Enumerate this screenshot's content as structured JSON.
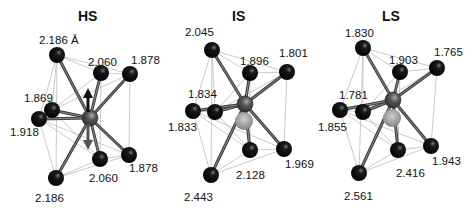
{
  "panels": [
    {
      "id": "hs",
      "title": "HS",
      "metal": {
        "x": 90,
        "y": 118
      },
      "arrow": true,
      "lower_sphere": false,
      "atoms": [
        {
          "name": "top-left",
          "x": 57,
          "y": 55,
          "bond": "2.186 Å",
          "lx": 39,
          "ly": 44
        },
        {
          "name": "top-mid",
          "x": 101,
          "y": 73,
          "bond": "2.060",
          "lx": 88,
          "ly": 66
        },
        {
          "name": "top-right",
          "x": 130,
          "y": 74,
          "bond": "1.878",
          "lx": 131,
          "ly": 64
        },
        {
          "name": "mid-inner",
          "x": 52,
          "y": 110,
          "bond": "1.869",
          "lx": 24,
          "ly": 102
        },
        {
          "name": "mid-left",
          "x": 39,
          "y": 119,
          "bond": "1.918",
          "lx": 10,
          "ly": 136
        },
        {
          "name": "bottom-left",
          "x": 56,
          "y": 178,
          "bond": "2.186",
          "lx": 35,
          "ly": 202
        },
        {
          "name": "bottom-mid",
          "x": 100,
          "y": 159,
          "bond": "2.060",
          "lx": 89,
          "ly": 182
        },
        {
          "name": "bottom-right",
          "x": 129,
          "y": 155,
          "bond": "1.878",
          "lx": 129,
          "ly": 172
        }
      ]
    },
    {
      "id": "is",
      "title": "IS",
      "metal": {
        "x": 245,
        "y": 104
      },
      "arrow": false,
      "lower_sphere": true,
      "sphere": {
        "x": 244,
        "y": 121
      },
      "atoms": [
        {
          "name": "top-left",
          "x": 212,
          "y": 50,
          "bond": "2.045",
          "lx": 185,
          "ly": 36
        },
        {
          "name": "top-mid",
          "x": 250,
          "y": 73,
          "bond": "1.896",
          "lx": 240,
          "ly": 65
        },
        {
          "name": "top-right",
          "x": 287,
          "y": 72,
          "bond": "1.801",
          "lx": 279,
          "ly": 57
        },
        {
          "name": "mid-inner",
          "x": 215,
          "y": 112,
          "bond": "1.834",
          "lx": 188,
          "ly": 98
        },
        {
          "name": "mid-left",
          "x": 193,
          "y": 111,
          "bond": "1.833",
          "lx": 168,
          "ly": 131
        },
        {
          "name": "bottom-left",
          "x": 211,
          "y": 175,
          "bond": "2.443",
          "lx": 184,
          "ly": 201
        },
        {
          "name": "bottom-mid",
          "x": 250,
          "y": 150,
          "bond": "2.128",
          "lx": 236,
          "ly": 179
        },
        {
          "name": "bottom-right",
          "x": 284,
          "y": 149,
          "bond": "1.969",
          "lx": 285,
          "ly": 168
        }
      ]
    },
    {
      "id": "ls",
      "title": "LS",
      "metal": {
        "x": 393,
        "y": 100
      },
      "arrow": false,
      "lower_sphere": true,
      "sphere": {
        "x": 392,
        "y": 118
      },
      "atoms": [
        {
          "name": "top-left",
          "x": 363,
          "y": 48,
          "bond": "1.830",
          "lx": 345,
          "ly": 37
        },
        {
          "name": "top-mid",
          "x": 400,
          "y": 72,
          "bond": "1.903",
          "lx": 389,
          "ly": 64
        },
        {
          "name": "top-right",
          "x": 437,
          "y": 68,
          "bond": "1.765",
          "lx": 434,
          "ly": 56
        },
        {
          "name": "mid-inner",
          "x": 363,
          "y": 112,
          "bond": "1.781",
          "lx": 339,
          "ly": 99
        },
        {
          "name": "mid-left",
          "x": 340,
          "y": 110,
          "bond": "1.855",
          "lx": 318,
          "ly": 131
        },
        {
          "name": "bottom-left",
          "x": 359,
          "y": 173,
          "bond": "2.561",
          "lx": 344,
          "ly": 200
        },
        {
          "name": "bottom-mid",
          "x": 398,
          "y": 150,
          "bond": "2.416",
          "lx": 396,
          "ly": 177
        },
        {
          "name": "bottom-right",
          "x": 431,
          "y": 146,
          "bond": "1.943",
          "lx": 432,
          "ly": 165
        }
      ]
    }
  ],
  "titles": {
    "hs": {
      "text": "HS",
      "x": 78,
      "y": 21
    },
    "is": {
      "text": "IS",
      "x": 231,
      "y": 21
    },
    "ls": {
      "text": "LS",
      "x": 381,
      "y": 21
    }
  },
  "labels": {
    "hs": [
      "2.186 Å",
      "2.060",
      "1.878",
      "1.869",
      "1.918",
      "2.186",
      "2.060",
      "1.878"
    ],
    "is": [
      "2.045",
      "1.896",
      "1.801",
      "1.834",
      "1.833",
      "2.443",
      "2.128",
      "1.969"
    ],
    "ls": [
      "1.830",
      "1.903",
      "1.765",
      "1.781",
      "1.855",
      "2.561",
      "2.416",
      "1.943"
    ]
  },
  "colors": {
    "atom": "#0a0a0a",
    "metal": "#555555",
    "bond": "#555555",
    "edge": "#bbbbbb",
    "sphere": "#9a9a9a"
  }
}
